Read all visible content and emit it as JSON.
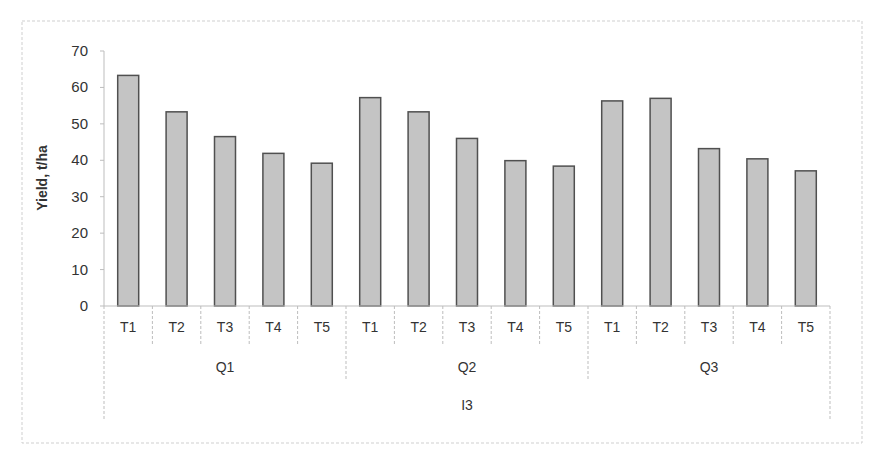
{
  "chart_data": {
    "type": "bar",
    "title": "",
    "xlabel": "",
    "ylabel": "Yield, t/ha",
    "ylim": [
      0,
      70
    ],
    "yticks": [
      0,
      10,
      20,
      30,
      40,
      50,
      60,
      70
    ],
    "grid": false,
    "legend": "none",
    "categories": [
      "T1",
      "T2",
      "T3",
      "T4",
      "T5",
      "T1",
      "T2",
      "T3",
      "T4",
      "T5",
      "T1",
      "T2",
      "T3",
      "T4",
      "T5"
    ],
    "groups": [
      {
        "name": "Q1",
        "categories": [
          "T1",
          "T2",
          "T3",
          "T4",
          "T5"
        ],
        "values": [
          63.3,
          53.3,
          46.5,
          41.9,
          39.2
        ]
      },
      {
        "name": "Q2",
        "categories": [
          "T1",
          "T2",
          "T3",
          "T4",
          "T5"
        ],
        "values": [
          57.2,
          53.3,
          46.0,
          39.9,
          38.4
        ]
      },
      {
        "name": "Q3",
        "categories": [
          "T1",
          "T2",
          "T3",
          "T4",
          "T5"
        ],
        "values": [
          56.3,
          57.0,
          43.2,
          40.4,
          37.1
        ]
      }
    ],
    "outer_group": "I3",
    "series": [
      {
        "name": "Yield",
        "values": [
          63.3,
          53.3,
          46.5,
          41.9,
          39.2,
          57.2,
          53.3,
          46.0,
          39.9,
          38.4,
          56.3,
          57.0,
          43.2,
          40.4,
          37.1
        ]
      }
    ],
    "colors": {
      "bar_fill": "#c4c4c4",
      "bar_stroke": "#505050",
      "axis": "#bdbdbd",
      "text": "#333333"
    }
  }
}
